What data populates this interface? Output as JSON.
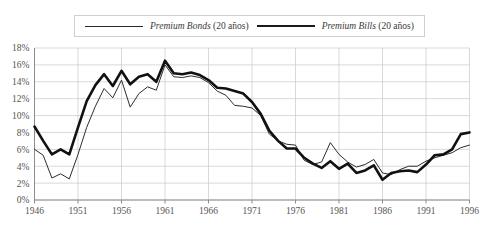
{
  "chart_data": {
    "type": "line",
    "title": "",
    "xlabel": "",
    "ylabel": "",
    "xlim": [
      1946,
      1996
    ],
    "ylim": [
      0,
      18
    ],
    "grid": true,
    "legend_position": "top-center",
    "y_tick_labels": [
      "18%",
      "16%",
      "14%",
      "12%",
      "10%",
      "8%",
      "6%",
      "4%",
      "2%",
      "0%"
    ],
    "y_ticks": [
      18,
      16,
      14,
      12,
      10,
      8,
      6,
      4,
      2,
      0
    ],
    "x_tick_labels": [
      "1946",
      "1951",
      "1956",
      "1961",
      "1966",
      "1971",
      "1976",
      "1981",
      "1986",
      "1991",
      "1996"
    ],
    "x_ticks": [
      1946,
      1951,
      1956,
      1961,
      1966,
      1971,
      1976,
      1981,
      1986,
      1991,
      1996
    ],
    "x": [
      1946,
      1947,
      1948,
      1949,
      1950,
      1951,
      1952,
      1953,
      1954,
      1955,
      1956,
      1957,
      1958,
      1959,
      1960,
      1961,
      1962,
      1963,
      1964,
      1965,
      1966,
      1967,
      1968,
      1969,
      1970,
      1971,
      1972,
      1973,
      1974,
      1975,
      1976,
      1977,
      1978,
      1979,
      1980,
      1981,
      1982,
      1983,
      1984,
      1985,
      1986,
      1987,
      1988,
      1989,
      1990,
      1991,
      1992,
      1993,
      1994,
      1995,
      1996
    ],
    "series": [
      {
        "name": "Premium Bonds (20 años)",
        "style": "thin",
        "color": "#2d2d2d",
        "values": [
          6.0,
          5.3,
          2.6,
          3.1,
          2.5,
          5.4,
          8.6,
          11.1,
          13.2,
          12.1,
          14.2,
          11.0,
          12.6,
          13.4,
          13.0,
          16.0,
          14.6,
          14.5,
          14.7,
          14.5,
          13.9,
          12.9,
          12.4,
          11.2,
          11.1,
          10.9,
          10.0,
          7.8,
          7.0,
          6.6,
          6.5,
          4.7,
          4.2,
          4.5,
          6.8,
          5.4,
          4.5,
          3.9,
          4.2,
          4.8,
          3.2,
          3.0,
          3.6,
          4.0,
          4.0,
          4.6,
          5.0,
          5.3,
          5.6,
          6.2,
          6.5
        ]
      },
      {
        "name": "Premium Bills (20 años)",
        "style": "thick",
        "color": "#111111",
        "values": [
          8.7,
          7.0,
          5.4,
          6.0,
          5.4,
          8.6,
          11.7,
          13.6,
          14.9,
          13.5,
          15.3,
          13.7,
          14.6,
          14.9,
          14.0,
          16.5,
          15.0,
          14.9,
          15.1,
          14.8,
          14.2,
          13.3,
          13.2,
          12.9,
          12.6,
          11.6,
          10.2,
          8.2,
          7.0,
          6.1,
          6.1,
          5.0,
          4.3,
          3.8,
          4.6,
          3.7,
          4.3,
          3.2,
          3.5,
          4.1,
          2.4,
          3.2,
          3.4,
          3.5,
          3.3,
          4.2,
          5.3,
          5.4,
          6.0,
          7.8,
          8.0
        ]
      }
    ]
  },
  "legend": {
    "bonds": {
      "name_italic": "Premium Bonds",
      "suffix": " (20 años)"
    },
    "bills": {
      "name_italic": "Premium Bills",
      "suffix": " (20 años)"
    }
  }
}
